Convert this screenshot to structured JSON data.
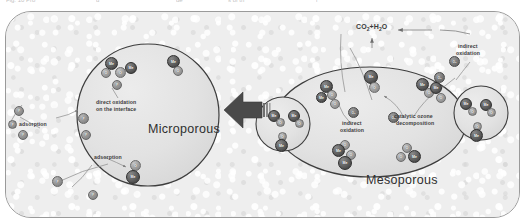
{
  "figure": {
    "top_caption_fragments": [
      {
        "text": "Fig. 10  Pro",
        "x": 6
      },
      {
        "text": "d",
        "x": 96
      },
      {
        "text": "de",
        "x": 176
      },
      {
        "text": "s of th",
        "x": 228
      },
      {
        "text": "r",
        "x": 316
      }
    ],
    "regions": {
      "micropore_label": "Microporous",
      "mesopore_label": "Mesoporous"
    },
    "annotations": {
      "direct_oxidation_line1": "direct oxidation",
      "direct_oxidation_line2": "on the interface",
      "adsorption_upper": "adsorption",
      "adsorption_lower": "adsorption",
      "indirect_oxidation_center_line1": "indirect",
      "indirect_oxidation_center_line2": "oxidation",
      "indirect_oxidation_top_line1": "indirect",
      "indirect_oxidation_top_line2": "oxidation",
      "catalytic_ozone_line1": "catalytic ozone",
      "catalytic_ozone_line2": "decomposition",
      "product_label_prefix": "CO",
      "product_label_sub1": "2",
      "product_label_mid": "+H",
      "product_label_sub2": "2",
      "product_label_suffix": "O"
    },
    "species": {
      "metal": "Me",
      "oxygen": "O",
      "pollutant": "P",
      "ozone": "O₃"
    },
    "colors": {
      "panel_background": "#eeeeee",
      "panel_border": "#9a9a9a",
      "metal_sphere": "#4a4a4a",
      "oxygen_sphere": "#8b8b8b",
      "region_fill": "#e3e3e3",
      "region_stroke": "#3a3a3a",
      "arrow_fill": "#4a4a4a",
      "label_text": "#3b3b3b"
    }
  }
}
